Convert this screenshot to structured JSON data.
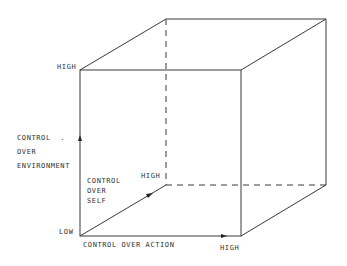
{
  "diagram": {
    "type": "3d-cube-axes",
    "axes": {
      "vertical": {
        "title_lines": [
          "CONTROL  .",
          "OVER",
          "ENVIRONMENT"
        ],
        "low": "LOW",
        "high": "HIGH"
      },
      "horizontal": {
        "title": "CONTROL OVER ACTION",
        "high": "HIGH"
      },
      "depth": {
        "title_lines": [
          "CONTROL",
          "OVER",
          "SELF"
        ],
        "high": "HIGH"
      }
    },
    "colors": {
      "line": "#333333",
      "background": "#ffffff"
    }
  }
}
